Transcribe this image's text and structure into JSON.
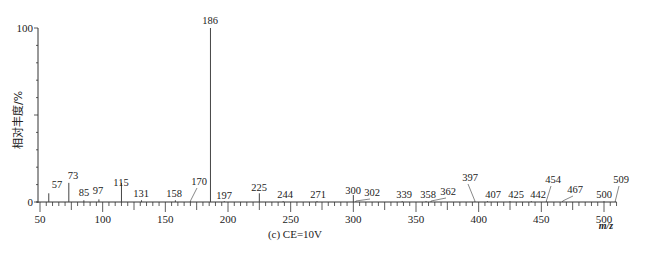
{
  "chart_data": {
    "type": "bar",
    "subtype": "mass-spectrum-stick",
    "title": "",
    "caption": "(c) CE=10V",
    "xlabel": "m/z",
    "ylabel": "相对丰度/%",
    "xlim": [
      50,
      510
    ],
    "ylim": [
      0,
      100
    ],
    "x_ticks": [
      50,
      100,
      150,
      200,
      250,
      300,
      350,
      400,
      450,
      500
    ],
    "y_ticks": [
      0,
      100
    ],
    "grid": false,
    "legend": null,
    "peaks": [
      {
        "mz": 57,
        "intensity": 5,
        "label": "57"
      },
      {
        "mz": 73,
        "intensity": 11,
        "label": "73"
      },
      {
        "mz": 85,
        "intensity": 1,
        "label": "85"
      },
      {
        "mz": 97,
        "intensity": 1.5,
        "label": "97"
      },
      {
        "mz": 115,
        "intensity": 11,
        "label": "115"
      },
      {
        "mz": 131,
        "intensity": 1,
        "label": "131"
      },
      {
        "mz": 158,
        "intensity": 1,
        "label": "158"
      },
      {
        "mz": 170,
        "intensity": 0.5,
        "label": "170"
      },
      {
        "mz": 186,
        "intensity": 100,
        "label": "186"
      },
      {
        "mz": 197,
        "intensity": 0.5,
        "label": "197"
      },
      {
        "mz": 225,
        "intensity": 5,
        "label": "225"
      },
      {
        "mz": 244,
        "intensity": 0.5,
        "label": "244"
      },
      {
        "mz": 271,
        "intensity": 0.5,
        "label": "271"
      },
      {
        "mz": 300,
        "intensity": 4,
        "label": "300"
      },
      {
        "mz": 302,
        "intensity": 0.5,
        "label": "302"
      },
      {
        "mz": 339,
        "intensity": 0.5,
        "label": "339"
      },
      {
        "mz": 358,
        "intensity": 0.5,
        "label": "358"
      },
      {
        "mz": 362,
        "intensity": 0.5,
        "label": "362"
      },
      {
        "mz": 397,
        "intensity": 0.5,
        "label": "397"
      },
      {
        "mz": 407,
        "intensity": 0.5,
        "label": "407"
      },
      {
        "mz": 425,
        "intensity": 0.5,
        "label": "425"
      },
      {
        "mz": 442,
        "intensity": 0.5,
        "label": "442"
      },
      {
        "mz": 454,
        "intensity": 0.5,
        "label": "454"
      },
      {
        "mz": 467,
        "intensity": 0.5,
        "label": "467"
      },
      {
        "mz": 500,
        "intensity": 0.5,
        "label": "500"
      },
      {
        "mz": 509,
        "intensity": 0.5,
        "label": "509"
      }
    ],
    "categories": [
      "57",
      "73",
      "85",
      "97",
      "115",
      "131",
      "158",
      "170",
      "186",
      "197",
      "225",
      "244",
      "271",
      "300",
      "302",
      "339",
      "358",
      "362",
      "397",
      "407",
      "425",
      "442",
      "454",
      "467",
      "500",
      "509"
    ],
    "values": [
      5,
      11,
      1,
      1.5,
      11,
      1,
      1,
      0.5,
      100,
      0.5,
      5,
      0.5,
      0.5,
      4,
      0.5,
      0.5,
      0.5,
      0.5,
      0.5,
      0.5,
      0.5,
      0.5,
      0.5,
      0.5,
      0.5,
      0.5
    ]
  },
  "layout_labels": {
    "57": {
      "lx": 57,
      "ly": 188,
      "leader": false
    },
    "73": {
      "lx": 73,
      "ly": 179,
      "leader": false
    },
    "85": {
      "lx": 84,
      "ly": 196,
      "leader": false
    },
    "97": {
      "lx": 98,
      "ly": 194,
      "leader": false
    },
    "115": {
      "lx": 121,
      "ly": 186,
      "leader": false
    },
    "131": {
      "lx": 141,
      "ly": 197,
      "leader": false
    },
    "158": {
      "lx": 174,
      "ly": 197,
      "leader": false
    },
    "170": {
      "lx": 199,
      "ly": 185,
      "leader": true
    },
    "186": {
      "lx": 210,
      "ly": 24,
      "leader": false
    },
    "197": {
      "lx": 224,
      "ly": 199,
      "leader": false
    },
    "225": {
      "lx": 259,
      "ly": 191,
      "leader": false
    },
    "244": {
      "lx": 285,
      "ly": 198,
      "leader": false
    },
    "271": {
      "lx": 318,
      "ly": 198,
      "leader": false
    },
    "300": {
      "lx": 353,
      "ly": 194,
      "leader": false
    },
    "302": {
      "lx": 372,
      "ly": 196,
      "leader": true
    },
    "339": {
      "lx": 404,
      "ly": 198,
      "leader": false
    },
    "358": {
      "lx": 428,
      "ly": 198,
      "leader": false
    },
    "362": {
      "lx": 448,
      "ly": 195,
      "leader": true
    },
    "397": {
      "lx": 470,
      "ly": 181,
      "leader": true
    },
    "407": {
      "lx": 493,
      "ly": 198,
      "leader": false
    },
    "425": {
      "lx": 516,
      "ly": 198,
      "leader": false
    },
    "442": {
      "lx": 538,
      "ly": 198,
      "leader": false
    },
    "454": {
      "lx": 553,
      "ly": 183,
      "leader": true
    },
    "467": {
      "lx": 575,
      "ly": 193,
      "leader": true
    },
    "500": {
      "lx": 604,
      "ly": 198,
      "leader": false
    },
    "509": {
      "lx": 621,
      "ly": 183,
      "leader": true
    }
  }
}
